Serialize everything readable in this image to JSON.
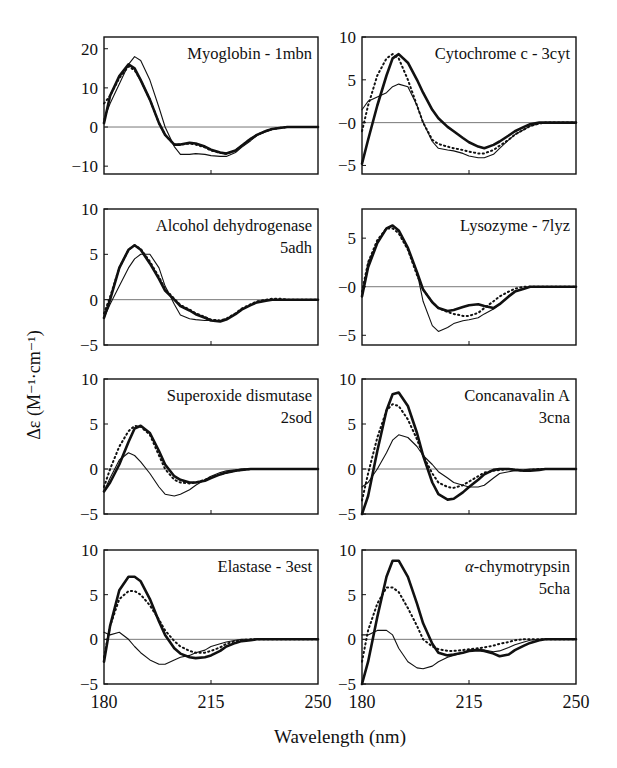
{
  "figure": {
    "ylabel": "Δε (M⁻¹·cm⁻¹)",
    "xlabel": "Wavelength (nm)",
    "x_ticks": [
      "180",
      "215",
      "250"
    ]
  },
  "legend_styles": {
    "thick_solid": "heavy solid line",
    "dotted": "dotted line",
    "thin_solid": "thin solid line"
  },
  "chart_data": [
    {
      "type": "line",
      "title": "Myoglobin - 1mbn",
      "xlabel": "Wavelength (nm)",
      "ylabel": "Δε (M⁻¹·cm⁻¹)",
      "xlim": [
        180,
        250
      ],
      "ylim": [
        -12,
        23
      ],
      "yticks": [
        -10,
        0,
        10,
        20
      ],
      "x": [
        180,
        182,
        185,
        188,
        190,
        192,
        195,
        198,
        200,
        203,
        205,
        208,
        210,
        213,
        215,
        218,
        220,
        223,
        225,
        228,
        230,
        233,
        235,
        238,
        240,
        245,
        250
      ],
      "series": [
        {
          "name": "thick_solid",
          "values": [
            1,
            8,
            13,
            16,
            15,
            12,
            7,
            1,
            -2,
            -4.5,
            -4.5,
            -4,
            -4.2,
            -5,
            -5.8,
            -6.5,
            -6.8,
            -6,
            -4.8,
            -3,
            -2,
            -1,
            -0.5,
            -0.2,
            0,
            0,
            0
          ]
        },
        {
          "name": "dotted",
          "values": [
            6,
            8,
            12.5,
            15.5,
            14.5,
            12,
            7,
            1,
            -2,
            -4.5,
            -4.5,
            -4.2,
            -4.5,
            -5.2,
            -6,
            -6.6,
            -6.8,
            -6,
            -4.8,
            -3,
            -2,
            -1,
            -0.5,
            -0.2,
            0,
            0,
            0
          ]
        },
        {
          "name": "thin_solid",
          "values": [
            2,
            6,
            11,
            16,
            18,
            17,
            12,
            5,
            0,
            -5,
            -7,
            -7,
            -6.8,
            -7,
            -7.3,
            -7.5,
            -7.5,
            -6.5,
            -5.2,
            -3.5,
            -2.2,
            -1.2,
            -0.6,
            -0.2,
            0,
            0,
            0
          ]
        }
      ]
    },
    {
      "type": "line",
      "title": "Cytochrome c - 3cyt",
      "xlim": [
        180,
        250
      ],
      "ylim": [
        -6,
        10
      ],
      "yticks": [
        -5,
        0,
        5,
        10
      ],
      "ytick_labels": [
        "−5",
        "−0",
        "5",
        "10"
      ],
      "x": [
        180,
        182,
        185,
        188,
        190,
        192,
        195,
        198,
        200,
        203,
        205,
        208,
        210,
        213,
        215,
        218,
        220,
        223,
        225,
        228,
        230,
        233,
        235,
        238,
        240,
        245,
        250
      ],
      "series": [
        {
          "name": "thick_solid",
          "values": [
            -4.8,
            -2,
            2,
            5.5,
            7.5,
            8,
            7,
            5,
            3.5,
            1.5,
            0.5,
            -0.5,
            -1,
            -1.8,
            -2.3,
            -2.8,
            -3,
            -2.6,
            -2.2,
            -1.5,
            -1,
            -0.5,
            -0.2,
            0,
            0,
            0,
            0
          ]
        },
        {
          "name": "dotted",
          "values": [
            -1,
            2,
            5.5,
            7.5,
            8,
            7.5,
            5,
            2,
            0,
            -2,
            -2.5,
            -2.8,
            -3,
            -3.2,
            -3.4,
            -3.6,
            -3.6,
            -3.2,
            -2.7,
            -2,
            -1.4,
            -0.8,
            -0.4,
            -0.1,
            0,
            0,
            0
          ]
        },
        {
          "name": "thin_solid",
          "values": [
            1.5,
            2.5,
            3,
            3.5,
            4.2,
            4.5,
            4.2,
            2,
            0,
            -2.2,
            -3,
            -3.2,
            -3.3,
            -3.6,
            -3.9,
            -4.1,
            -4.1,
            -3.7,
            -3,
            -2,
            -1.4,
            -0.8,
            -0.4,
            -0.1,
            0,
            0,
            0
          ]
        }
      ]
    },
    {
      "type": "line",
      "title": "Alcohol dehydrogenase 5adh",
      "xlim": [
        180,
        250
      ],
      "ylim": [
        -5,
        10
      ],
      "yticks": [
        -5,
        0,
        5,
        10
      ],
      "x": [
        180,
        182,
        185,
        188,
        190,
        192,
        195,
        198,
        200,
        203,
        205,
        208,
        210,
        213,
        215,
        218,
        220,
        223,
        225,
        228,
        230,
        233,
        235,
        238,
        240,
        245,
        250
      ],
      "series": [
        {
          "name": "thick_solid",
          "values": [
            -2,
            0,
            3.5,
            5.5,
            6,
            5.5,
            4,
            2.3,
            1,
            0,
            -0.7,
            -1.2,
            -1.6,
            -2,
            -2.3,
            -2.4,
            -2.2,
            -1.6,
            -1.1,
            -0.6,
            -0.3,
            -0.1,
            0,
            0,
            0,
            0,
            0
          ]
        },
        {
          "name": "dotted",
          "values": [
            -1.5,
            0.3,
            3.5,
            5.5,
            6,
            5.6,
            4.2,
            2.5,
            1.2,
            0.1,
            -0.6,
            -1.1,
            -1.5,
            -1.9,
            -2.2,
            -2.3,
            -2.1,
            -1.5,
            -1,
            -0.5,
            -0.2,
            0,
            0.1,
            0.1,
            0,
            0,
            0
          ]
        },
        {
          "name": "thin_solid",
          "values": [
            -2,
            -0.5,
            1.5,
            3.5,
            4.5,
            5,
            5,
            3.5,
            1.5,
            -0.5,
            -1.7,
            -2.1,
            -2.2,
            -2.3,
            -2.3,
            -2.3,
            -2.1,
            -1.6,
            -1.1,
            -0.6,
            -0.3,
            -0.1,
            0,
            0,
            0,
            0,
            0
          ]
        }
      ]
    },
    {
      "type": "line",
      "title": "Lysozyme - 7lyz",
      "xlim": [
        180,
        250
      ],
      "ylim": [
        -6,
        8
      ],
      "yticks": [
        -5,
        0,
        5
      ],
      "ytick_labels": [
        "−5",
        "−0",
        "5"
      ],
      "x": [
        180,
        182,
        185,
        188,
        190,
        192,
        195,
        198,
        200,
        203,
        205,
        208,
        210,
        213,
        215,
        218,
        220,
        223,
        225,
        228,
        230,
        233,
        235,
        238,
        240,
        245,
        250
      ],
      "series": [
        {
          "name": "thick_solid",
          "values": [
            -1,
            2,
            4.5,
            6,
            6.3,
            5.8,
            4,
            1.5,
            -0.3,
            -1.6,
            -2.2,
            -2.5,
            -2.4,
            -2.1,
            -1.9,
            -1.8,
            -2,
            -2.2,
            -1.8,
            -1,
            -0.5,
            -0.2,
            0,
            0,
            0,
            0,
            0
          ]
        },
        {
          "name": "dotted",
          "values": [
            -0.5,
            2.5,
            4.8,
            6,
            6,
            5.5,
            3.8,
            1.2,
            -0.3,
            -1.6,
            -2.2,
            -2.6,
            -2.8,
            -3,
            -3,
            -2.7,
            -2.2,
            -1.5,
            -1,
            -0.5,
            -0.2,
            0,
            0,
            0,
            0,
            0,
            0
          ]
        },
        {
          "name": "thin_solid",
          "values": [
            -1,
            2.5,
            4.5,
            6,
            6.3,
            5.8,
            4,
            1.5,
            -1.5,
            -4,
            -4.6,
            -4.2,
            -3.8,
            -3.5,
            -3.4,
            -3.2,
            -2.8,
            -2.3,
            -1.8,
            -1,
            -0.5,
            -0.2,
            0,
            0,
            0,
            0,
            0
          ]
        }
      ]
    },
    {
      "type": "line",
      "title": "Superoxide dismutase 2sod",
      "xlim": [
        180,
        250
      ],
      "ylim": [
        -5,
        10
      ],
      "yticks": [
        -5,
        0,
        5,
        10
      ],
      "x": [
        180,
        182,
        185,
        188,
        190,
        192,
        195,
        198,
        200,
        203,
        205,
        208,
        210,
        213,
        215,
        218,
        220,
        223,
        225,
        228,
        230,
        233,
        235,
        238,
        240,
        245,
        250
      ],
      "series": [
        {
          "name": "thick_solid",
          "values": [
            -2.5,
            -1.5,
            0.5,
            3,
            4.5,
            4.8,
            4,
            2,
            0.5,
            -0.8,
            -1.2,
            -1.5,
            -1.5,
            -1.3,
            -1,
            -0.6,
            -0.4,
            -0.2,
            -0.1,
            0,
            0,
            0,
            0,
            0,
            0,
            0,
            0
          ]
        },
        {
          "name": "dotted",
          "values": [
            -2,
            0,
            2.5,
            4.2,
            4.8,
            4.7,
            3.8,
            1.5,
            0,
            -1.2,
            -1.5,
            -1.6,
            -1.5,
            -1.2,
            -0.9,
            -0.6,
            -0.4,
            -0.2,
            -0.1,
            0,
            0,
            0,
            0,
            0,
            0,
            0,
            0
          ]
        },
        {
          "name": "thin_solid",
          "values": [
            -2.5,
            -1,
            1,
            1.8,
            1.5,
            0.8,
            -0.5,
            -2,
            -2.8,
            -3,
            -2.8,
            -2.3,
            -1.8,
            -1.2,
            -0.8,
            -0.4,
            -0.2,
            -0.1,
            0,
            0,
            0,
            0,
            0,
            0,
            0,
            0,
            0
          ]
        }
      ]
    },
    {
      "type": "line",
      "title": "Concanavalin A 3cna",
      "xlim": [
        180,
        250
      ],
      "ylim": [
        -5,
        10
      ],
      "yticks": [
        -5,
        0,
        5,
        10
      ],
      "x": [
        180,
        182,
        185,
        188,
        190,
        192,
        195,
        198,
        200,
        203,
        205,
        208,
        210,
        213,
        215,
        218,
        220,
        223,
        225,
        228,
        230,
        233,
        235,
        238,
        240,
        245,
        250
      ],
      "series": [
        {
          "name": "thick_solid",
          "values": [
            -5,
            -3,
            2,
            6.5,
            8.3,
            8.5,
            7,
            4,
            1.5,
            -1.5,
            -2.8,
            -3.4,
            -3.3,
            -2.6,
            -2,
            -1.2,
            -0.6,
            -0.1,
            0,
            0,
            -0.1,
            -0.2,
            -0.2,
            -0.1,
            0,
            0,
            0
          ]
        },
        {
          "name": "dotted",
          "values": [
            -3.5,
            -0.5,
            3.5,
            6.5,
            7.2,
            7,
            5.5,
            3.3,
            1.5,
            -0.5,
            -1.5,
            -2,
            -2.1,
            -1.8,
            -1.4,
            -0.8,
            -0.4,
            -0.2,
            -0.1,
            0,
            -0.1,
            -0.2,
            -0.1,
            0,
            0,
            0,
            0
          ]
        },
        {
          "name": "thin_solid",
          "values": [
            -2,
            -1.5,
            0,
            1.8,
            3.2,
            3.8,
            3.5,
            2.5,
            1.5,
            0.5,
            -0.3,
            -1,
            -1.5,
            -1.8,
            -2,
            -2,
            -1.8,
            -1,
            -0.5,
            -0.3,
            -0.2,
            -0.1,
            0,
            0,
            0,
            0,
            0
          ]
        }
      ]
    },
    {
      "type": "line",
      "title": "Elastase - 3est",
      "xlim": [
        180,
        250
      ],
      "ylim": [
        -5,
        10
      ],
      "yticks": [
        -5,
        0,
        5,
        10
      ],
      "x": [
        180,
        182,
        185,
        188,
        190,
        192,
        195,
        198,
        200,
        203,
        205,
        208,
        210,
        213,
        215,
        218,
        220,
        223,
        225,
        228,
        230,
        233,
        235,
        238,
        240,
        245,
        250
      ],
      "series": [
        {
          "name": "thick_solid",
          "values": [
            -2.5,
            1.5,
            5.5,
            7,
            7,
            6.5,
            4.5,
            2,
            0.5,
            -1,
            -1.6,
            -2,
            -2.1,
            -2,
            -1.8,
            -1.3,
            -0.8,
            -0.4,
            -0.2,
            -0.1,
            0,
            0,
            0,
            0,
            0,
            0,
            0
          ]
        },
        {
          "name": "dotted",
          "values": [
            -2,
            1.5,
            4.5,
            5.4,
            5.4,
            5,
            3.8,
            2.2,
            1,
            -0.2,
            -0.8,
            -1.3,
            -1.5,
            -1.5,
            -1.3,
            -0.9,
            -0.5,
            -0.2,
            -0.1,
            0,
            0,
            0,
            0,
            0,
            0,
            0,
            0
          ]
        },
        {
          "name": "thin_solid",
          "values": [
            0.8,
            0.5,
            0.8,
            0,
            -0.8,
            -1.5,
            -2.3,
            -2.8,
            -2.8,
            -2.3,
            -2,
            -1.8,
            -1.5,
            -1.2,
            -0.8,
            -0.5,
            -0.3,
            -0.1,
            0,
            0,
            0,
            0,
            0,
            0,
            0,
            0,
            0
          ]
        }
      ]
    },
    {
      "type": "line",
      "title": "α-chymotrypsin 5cha",
      "xlim": [
        180,
        250
      ],
      "ylim": [
        -5,
        10
      ],
      "yticks": [
        -5,
        0,
        5,
        10
      ],
      "x": [
        180,
        182,
        185,
        188,
        190,
        192,
        195,
        198,
        200,
        203,
        205,
        208,
        210,
        213,
        215,
        218,
        220,
        223,
        225,
        228,
        230,
        233,
        235,
        238,
        240,
        245,
        250
      ],
      "series": [
        {
          "name": "thick_solid",
          "values": [
            -5,
            -2.5,
            2.5,
            7,
            8.8,
            8.8,
            7,
            4,
            1.8,
            -0.5,
            -1.5,
            -1.8,
            -1.7,
            -1.5,
            -1.3,
            -1.2,
            -1.3,
            -1.6,
            -1.9,
            -1.7,
            -1.2,
            -0.7,
            -0.4,
            -0.1,
            0,
            0,
            0
          ]
        },
        {
          "name": "dotted",
          "values": [
            -2.5,
            1,
            4,
            5.8,
            5.8,
            5.3,
            3.5,
            1.5,
            0,
            -0.8,
            -1.1,
            -1.3,
            -1.3,
            -1.2,
            -1.1,
            -1,
            -0.9,
            -0.7,
            -0.5,
            -0.3,
            -0.1,
            0,
            0,
            0,
            0,
            0,
            0
          ]
        },
        {
          "name": "thin_solid",
          "values": [
            0.5,
            0.5,
            1,
            1,
            0.5,
            -1,
            -2.5,
            -3.2,
            -3.3,
            -3,
            -2.5,
            -2,
            -1.8,
            -1.5,
            -1.2,
            -1.1,
            -1.2,
            -1.4,
            -1.3,
            -0.9,
            -0.6,
            -0.3,
            -0.1,
            0,
            0,
            0,
            0
          ]
        }
      ]
    }
  ]
}
